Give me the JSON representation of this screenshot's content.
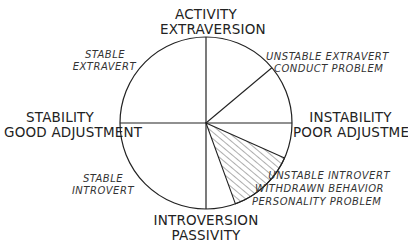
{
  "diagram": {
    "title": "",
    "axes": {
      "top": [
        "ACTIVITY",
        "EXTRAVERSION"
      ],
      "bottom": [
        "INTROVERSION",
        "PASSIVITY"
      ],
      "left": [
        "STABILITY",
        "GOOD ADJUSTMENT"
      ],
      "right": [
        "INSTABILITY",
        "POOR ADJUSTMENT"
      ]
    },
    "quadrant_labels": {
      "upper_left": [
        "STABLE",
        "EXTRAVERT"
      ],
      "upper_right": [
        "UNSTABLE EXTRAVERT",
        "CONDUCT PROBLEM"
      ],
      "lower_left": [
        "STABLE",
        "INTROVERT"
      ],
      "lower_right": [
        "UNSTABLE INTROVERT",
        "WITHDRAWN BEHAVIOR",
        "PERSONALITY PROBLEM"
      ]
    },
    "segments": [
      {
        "name": "upper-right-divider",
        "angle_deg": 40,
        "description": "radial line in upper-right quadrant"
      },
      {
        "name": "shaded-wedge",
        "start_angle_deg": -24,
        "end_angle_deg": -70,
        "hatched": true
      }
    ],
    "colors": {
      "line": "#222222",
      "hatch": "#333333",
      "background": "#ffffff"
    }
  }
}
